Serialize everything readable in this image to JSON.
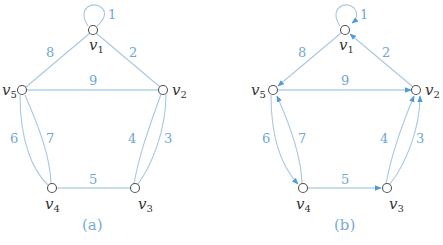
{
  "colors": {
    "edge": "#a9c8e2",
    "weight_label": "#6fa6d4",
    "arrow": "#4f9bd8",
    "node_stroke": "#555555",
    "vertex_label": "#333333"
  },
  "graphs": [
    {
      "caption": "(a)",
      "directed": false,
      "vertices": [
        {
          "name": "v",
          "sub": "1"
        },
        {
          "name": "v",
          "sub": "2"
        },
        {
          "name": "v",
          "sub": "3"
        },
        {
          "name": "v",
          "sub": "4"
        },
        {
          "name": "v",
          "sub": "5"
        }
      ],
      "edges": [
        {
          "weight": "1",
          "from": "v1",
          "to": "v1"
        },
        {
          "weight": "2",
          "from": "v1",
          "to": "v2"
        },
        {
          "weight": "3",
          "from": "v2",
          "to": "v3"
        },
        {
          "weight": "4",
          "from": "v3",
          "to": "v2"
        },
        {
          "weight": "5",
          "from": "v4",
          "to": "v3"
        },
        {
          "weight": "6",
          "from": "v5",
          "to": "v4"
        },
        {
          "weight": "7",
          "from": "v4",
          "to": "v5"
        },
        {
          "weight": "8",
          "from": "v1",
          "to": "v5"
        },
        {
          "weight": "9",
          "from": "v5",
          "to": "v2"
        }
      ]
    },
    {
      "caption": "(b)",
      "directed": true,
      "vertices": [
        {
          "name": "v",
          "sub": "1"
        },
        {
          "name": "v",
          "sub": "2"
        },
        {
          "name": "v",
          "sub": "3"
        },
        {
          "name": "v",
          "sub": "4"
        },
        {
          "name": "v",
          "sub": "5"
        }
      ],
      "edges": [
        {
          "weight": "1",
          "from": "v1",
          "to": "v1"
        },
        {
          "weight": "2",
          "from": "v2",
          "to": "v1"
        },
        {
          "weight": "3",
          "from": "v3",
          "to": "v2"
        },
        {
          "weight": "4",
          "from": "v3",
          "to": "v2"
        },
        {
          "weight": "5",
          "from": "v4",
          "to": "v3"
        },
        {
          "weight": "6",
          "from": "v5",
          "to": "v4"
        },
        {
          "weight": "7",
          "from": "v4",
          "to": "v5"
        },
        {
          "weight": "8",
          "from": "v1",
          "to": "v5"
        },
        {
          "weight": "9",
          "from": "v5",
          "to": "v2"
        }
      ]
    }
  ]
}
